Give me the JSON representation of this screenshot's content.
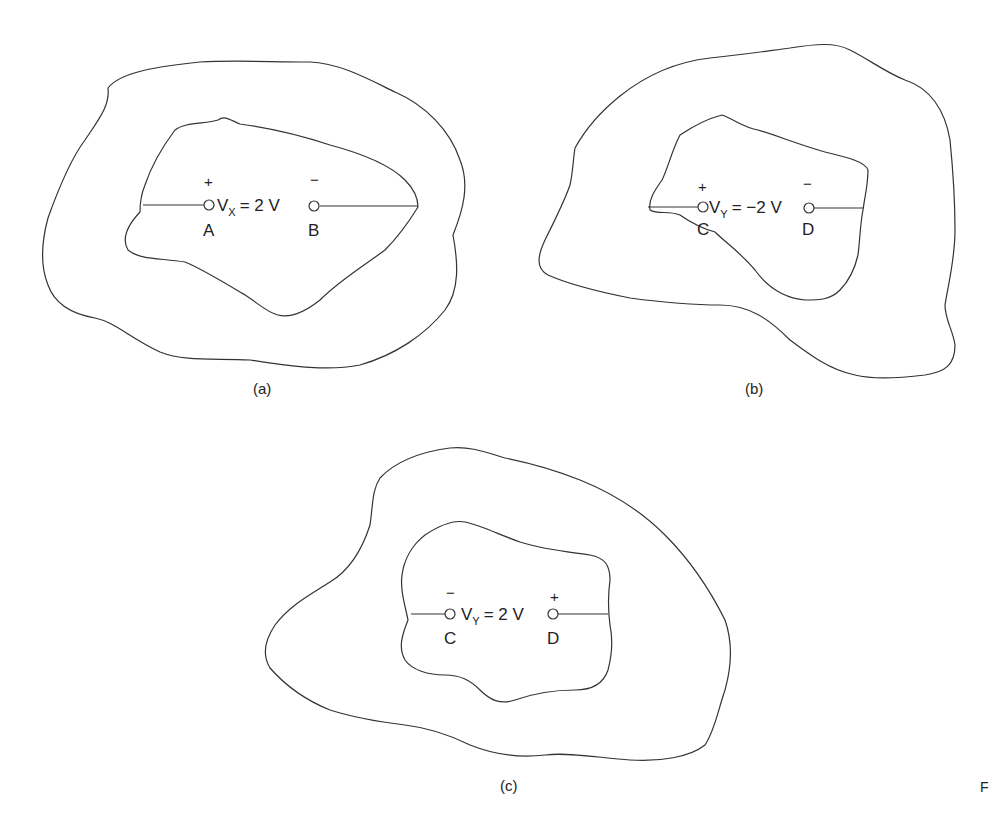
{
  "figure": {
    "panels": [
      {
        "caption": "(a)",
        "voltage": {
          "symbol": "V",
          "subscript": "X",
          "expr": "= 2 V"
        },
        "left_terminal": {
          "label": "A",
          "polarity": "+"
        },
        "right_terminal": {
          "label": "B",
          "polarity": "−"
        }
      },
      {
        "caption": "(b)",
        "voltage": {
          "symbol": "V",
          "subscript": "Y",
          "expr": "= −2 V"
        },
        "left_terminal": {
          "label": "C",
          "polarity": "+"
        },
        "right_terminal": {
          "label": "D",
          "polarity": "−"
        }
      },
      {
        "caption": "(c)",
        "voltage": {
          "symbol": "V",
          "subscript": "Y",
          "expr": "= 2 V"
        },
        "left_terminal": {
          "label": "C",
          "polarity": "−"
        },
        "right_terminal": {
          "label": "D",
          "polarity": "+"
        }
      }
    ],
    "edge_fragment": "F",
    "colors": {
      "line": "#333333",
      "text": "#222222",
      "background": "#ffffff"
    }
  }
}
